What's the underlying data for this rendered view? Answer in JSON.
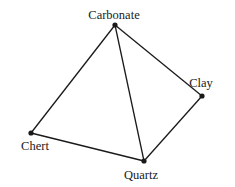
{
  "diagram": {
    "type": "tetrahedron",
    "vertices": [
      {
        "id": "carbonate",
        "label": "Carbonate",
        "x": 115,
        "y": 25,
        "lx": 114,
        "ly": 19
      },
      {
        "id": "clay",
        "label": "Clay",
        "x": 202,
        "y": 96,
        "lx": 201,
        "ly": 87
      },
      {
        "id": "chert",
        "label": "Chert",
        "x": 31,
        "y": 133,
        "lx": 35,
        "ly": 150
      },
      {
        "id": "quartz",
        "label": "Quartz",
        "x": 144,
        "y": 161,
        "lx": 141,
        "ly": 179
      }
    ],
    "edges": [
      [
        "carbonate",
        "chert"
      ],
      [
        "carbonate",
        "quartz"
      ],
      [
        "carbonate",
        "clay"
      ],
      [
        "chert",
        "quartz"
      ],
      [
        "quartz",
        "clay"
      ]
    ],
    "colors": {
      "line": "#1a1a1a",
      "background": "#ffffff"
    }
  }
}
